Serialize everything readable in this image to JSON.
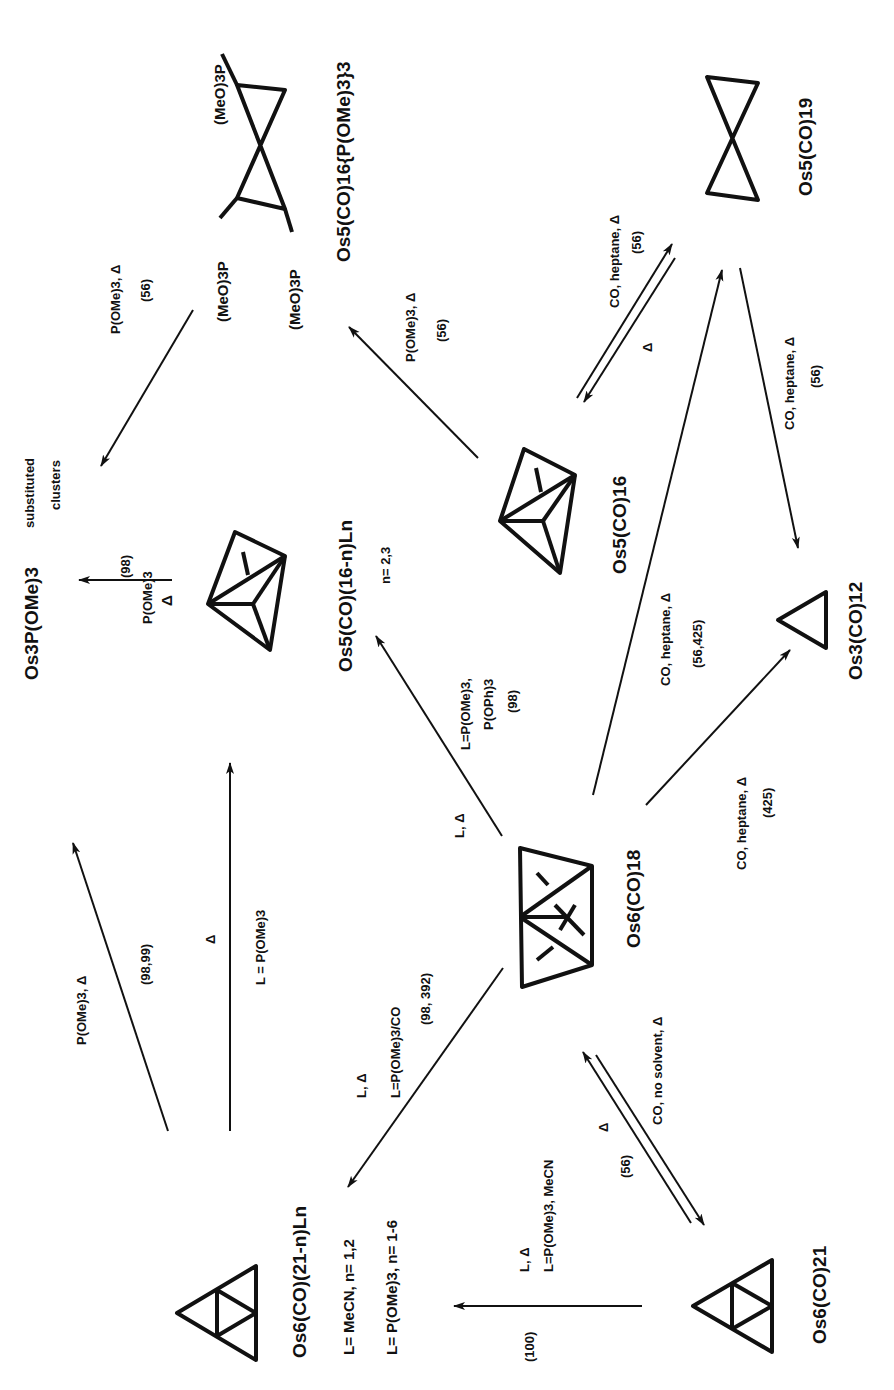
{
  "diagram": {
    "orientation": "rotated 90deg counter-clockwise (text reads bottom-to-top)",
    "colors": {
      "ink": "#111111",
      "background": "#ffffff"
    },
    "compounds": {
      "os6_18": {
        "label": "Os6(CO)18",
        "shape": "bicapped-tetrahedron"
      },
      "os6_21": {
        "label": "Os6(CO)21",
        "shape": "raft-triangles"
      },
      "os6_21_sub": {
        "label": "Os6(CO)(21-n)Ln",
        "notes": [
          "L= MeCN, n= 1,2",
          "L= P(OMe)3, n= 1-6"
        ],
        "shape": "raft-triangles"
      },
      "os5_16_ln": {
        "label": "Os5(CO)(16-n)Ln",
        "note": "n= 2,3",
        "shape": "trigonal-bipyramid"
      },
      "os5_16": {
        "label": "Os5(CO)16",
        "shape": "trigonal-bipyramid"
      },
      "os5_19": {
        "label": "Os5(CO)19",
        "shape": "bowtie"
      },
      "os5_16_pome": {
        "label": "Os5(CO)16{P(OMe)3}3",
        "ligand_labels": [
          "(MeO)3P",
          "(MeO)3P",
          "(MeO)3P"
        ],
        "shape": "bowtie"
      },
      "os3_12": {
        "label": "Os3(CO)12",
        "shape": "triangle"
      },
      "os3_sub": {
        "label": "Os3P(OMe)3",
        "suffix": [
          "substituted",
          "clusters"
        ]
      }
    },
    "reactions": [
      {
        "from": "os6_18",
        "to": "os6_21_sub",
        "conditions": [
          "L, Δ",
          "L=P(OMe)3/CO"
        ],
        "ref": "(98, 392)"
      },
      {
        "from": "os6_18",
        "to": "os6_21",
        "conditions": [
          "CO, no solvent, Δ"
        ],
        "reverse": "Δ",
        "ref": "(56)"
      },
      {
        "from": "os6_21",
        "to": "os6_21_sub",
        "conditions": [
          "L, Δ",
          "L=P(OMe)3, MeCN"
        ],
        "ref": "(100)"
      },
      {
        "from": "os6_21_sub",
        "to": "os3_sub",
        "conditions": [
          "P(OMe)3, Δ"
        ],
        "ref": "(98,99)"
      },
      {
        "from": "os6_21_sub",
        "to": "os5_16_ln",
        "conditions": [
          "Δ",
          "L = P(OMe)3"
        ]
      },
      {
        "from": "os6_18",
        "to": "os5_16_ln",
        "conditions": [
          "L, Δ",
          "L=P(OMe)3,",
          "P(OPh)3"
        ],
        "ref": "(98)"
      },
      {
        "from": "os5_16_ln",
        "to": "os3_sub",
        "conditions": [
          "P(OMe)3",
          "Δ"
        ],
        "ref": "(98)"
      },
      {
        "from": "os6_18",
        "to": "os3_12",
        "conditions": [
          "CO, heptane, Δ"
        ],
        "ref": "(425)"
      },
      {
        "from": "os6_18",
        "to": "os5_19",
        "conditions": [
          "CO, heptane, Δ"
        ],
        "ref": "(56,425)"
      },
      {
        "from": "os5_16",
        "to": "os5_19",
        "conditions": [
          "CO, heptane, Δ"
        ],
        "reverse": "Δ",
        "ref": "(56)"
      },
      {
        "from": "os5_19",
        "to": "os3_12",
        "conditions": [
          "CO, heptane, Δ"
        ],
        "ref": "(56)"
      },
      {
        "from": "os5_16",
        "to": "os5_16_pome",
        "conditions": [
          "P(OMe)3, Δ"
        ],
        "ref": "(56)"
      },
      {
        "from": "os5_16_pome",
        "to": "os3_sub",
        "conditions": [
          "P(OMe)3, Δ"
        ],
        "ref": "(56)"
      }
    ]
  }
}
